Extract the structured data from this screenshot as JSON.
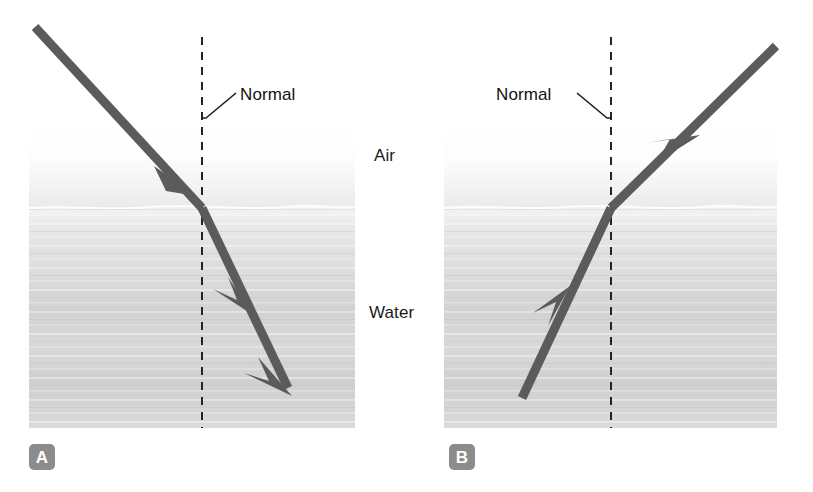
{
  "figure": {
    "background_color": "#ffffff",
    "ray_color": "#595959",
    "normal_color": "#222222",
    "badge_color": "#8c8c8c",
    "air_color": "#fbfbfb",
    "water_color": "#d8d8d8"
  },
  "labels": {
    "air": "Air",
    "water": "Water"
  },
  "panels": [
    {
      "id": "A",
      "badge": "A",
      "normal_label": "Normal",
      "description": "Light travelling from air into water bends toward the normal",
      "bounds": {
        "x": 29,
        "y": 117,
        "width": 326,
        "height": 311
      },
      "surface_y": 208,
      "normal_x": 202,
      "normal_top": 37,
      "normal_bottom": 428,
      "incident_ray": {
        "x1": 35,
        "y1": 27,
        "x2": 202,
        "y2": 208
      },
      "refracted_ray": {
        "x1": 202,
        "y1": 208,
        "x2": 288,
        "y2": 388
      },
      "leader_line": {
        "x1": 202,
        "y1": 118,
        "x2": 236,
        "y2": 93
      }
    },
    {
      "id": "B",
      "badge": "B",
      "normal_label": "Normal",
      "description": "Light travelling from water into air bends away from the normal",
      "bounds": {
        "x": 444,
        "y": 117,
        "width": 333,
        "height": 311
      },
      "surface_y": 208,
      "normal_x": 611,
      "normal_top": 37,
      "normal_bottom": 428,
      "incident_ray": {
        "x1": 522,
        "y1": 398,
        "x2": 611,
        "y2": 208
      },
      "refracted_ray": {
        "x1": 611,
        "y1": 208,
        "x2": 776,
        "y2": 46
      },
      "leader_line": {
        "x1": 611,
        "y1": 118,
        "x2": 577,
        "y2": 93
      }
    }
  ]
}
